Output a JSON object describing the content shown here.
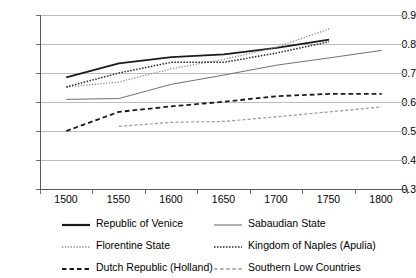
{
  "chart_data": {
    "type": "line",
    "title": "",
    "xlabel": "",
    "ylabel": "",
    "x": [
      1500,
      1550,
      1600,
      1650,
      1700,
      1750,
      1800
    ],
    "categories": [
      "1500",
      "1550",
      "1600",
      "1650",
      "1700",
      "1750",
      "1800"
    ],
    "xtick_labels": [
      "1500",
      "1550",
      "1600",
      "1650",
      "1700",
      "1750",
      "1800"
    ],
    "ytick_labels": [
      "0.9",
      "0.8",
      "0.7",
      "0.6",
      "0.5",
      "0.4",
      "0.3"
    ],
    "yticks": [
      0.9,
      0.8,
      0.7,
      0.6,
      0.5,
      0.4,
      0.3
    ],
    "ylim": [
      0.3,
      0.9
    ],
    "xlim": [
      1475,
      1825
    ],
    "grid": "horizontal",
    "legend_position": "bottom",
    "series": [
      {
        "name": "Republic of Venice",
        "style": "solid",
        "color": "#1a1a1a",
        "width": 1.8,
        "x": [
          1500,
          1550,
          1600,
          1650,
          1700,
          1750
        ],
        "values": [
          0.685,
          0.733,
          0.755,
          0.764,
          0.787,
          0.815
        ]
      },
      {
        "name": "Sabaudian State",
        "style": "solid",
        "color": "#707070",
        "width": 1.0,
        "x": [
          1500,
          1550,
          1600,
          1650,
          1700,
          1750,
          1800
        ],
        "values": [
          0.609,
          0.612,
          0.661,
          0.693,
          0.727,
          0.752,
          0.778
        ]
      },
      {
        "name": "Florentine State",
        "style": "dotted",
        "color": "#8a8a8a",
        "width": 1.3,
        "x": [
          1500,
          1550,
          1600,
          1650,
          1700,
          1750
        ],
        "values": [
          0.652,
          0.669,
          0.715,
          0.747,
          0.789,
          0.852
        ]
      },
      {
        "name": "Kingdom of Naples (Apulia)",
        "style": "fine-dotted",
        "color": "#262626",
        "width": 1.5,
        "x": [
          1500,
          1550,
          1600,
          1650,
          1700,
          1750
        ],
        "values": [
          0.652,
          0.7,
          0.737,
          0.737,
          0.769,
          0.808
        ]
      },
      {
        "name": "Dutch Republic (Holland)",
        "style": "dashed",
        "color": "#1a1a1a",
        "width": 1.8,
        "x": [
          1500,
          1550,
          1600,
          1650,
          1700,
          1750,
          1800
        ],
        "values": [
          0.5,
          0.566,
          0.585,
          0.601,
          0.62,
          0.628,
          0.628
        ]
      },
      {
        "name": "Southern Low Countries",
        "style": "dashed",
        "color": "#9a9a9a",
        "width": 1.2,
        "x": [
          1550,
          1600,
          1650,
          1700,
          1750,
          1800
        ],
        "values": [
          0.516,
          0.53,
          0.533,
          0.549,
          0.566,
          0.583
        ]
      }
    ]
  },
  "legend": {
    "items": [
      {
        "label": "Republic of Venice",
        "swatch": "solid-black-thick"
      },
      {
        "label": "Sabaudian State",
        "swatch": "solid-gray-thin"
      },
      {
        "label": "Florentine State",
        "swatch": "dotted-gray"
      },
      {
        "label": "Kingdom of Naples (Apulia)",
        "swatch": "fine-dotted-black"
      },
      {
        "label": "Dutch Republic (Holland)",
        "swatch": "dashed-black-thick"
      },
      {
        "label": "Southern Low Countries",
        "swatch": "dashed-gray-thin"
      }
    ]
  }
}
